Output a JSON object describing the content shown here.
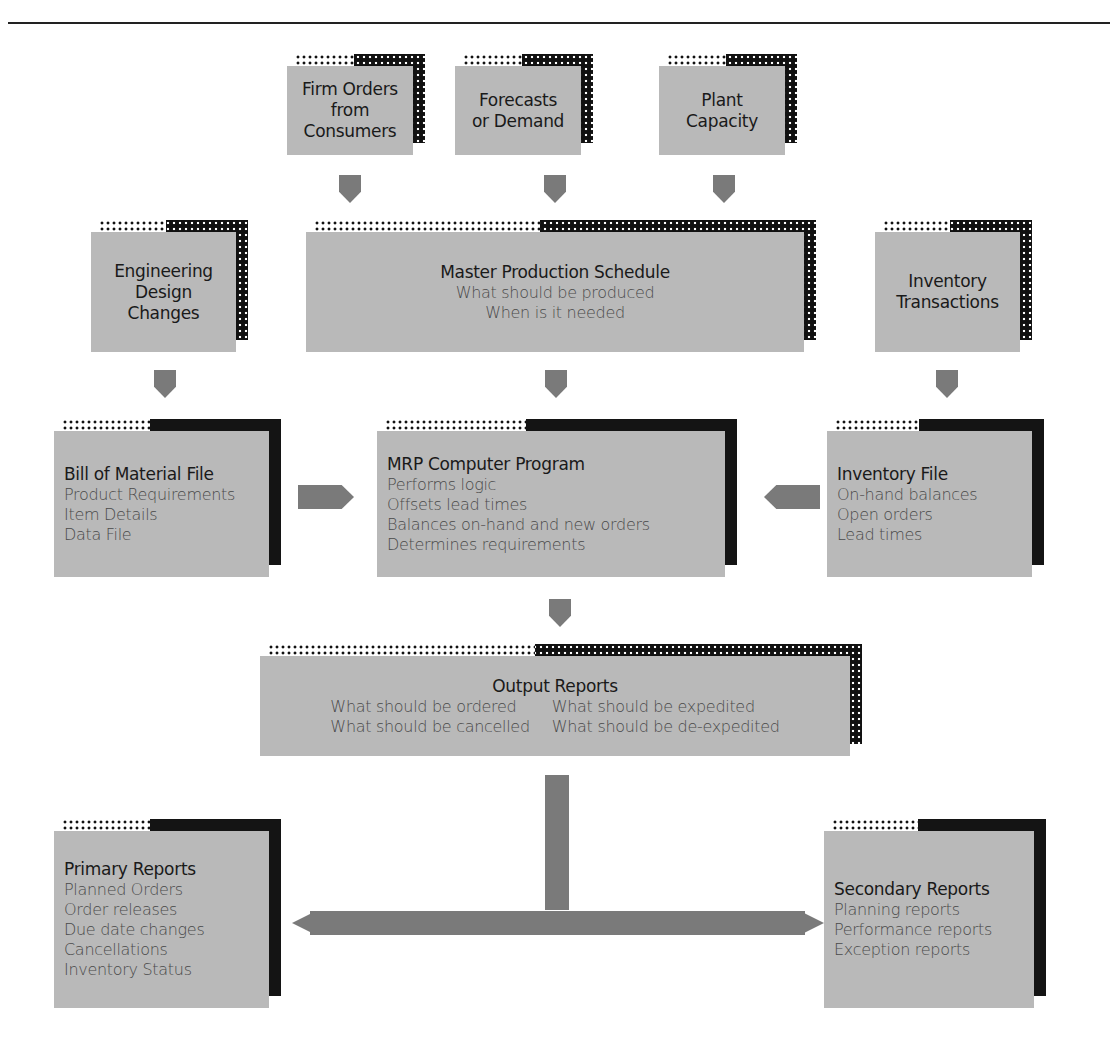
{
  "diagram": {
    "inputs": [
      {
        "id": "firm-orders",
        "lines": [
          "Firm Orders",
          "from",
          "Consumers"
        ]
      },
      {
        "id": "forecasts",
        "lines": [
          "Forecasts",
          "or Demand"
        ]
      },
      {
        "id": "plant-capacity",
        "lines": [
          "Plant",
          "Capacity"
        ]
      }
    ],
    "engineering": {
      "lines": [
        "Engineering",
        "Design",
        "Changes"
      ]
    },
    "mps": {
      "title": "Master Production Schedule",
      "items": [
        "What should be produced",
        "When is it needed"
      ]
    },
    "inventory_transactions": {
      "lines": [
        "Inventory",
        "Transactions"
      ]
    },
    "bom": {
      "title": "Bill of Material File",
      "items": [
        "Product Requirements",
        "Item Details",
        "Data File"
      ]
    },
    "mrp": {
      "title": "MRP Computer Program",
      "items": [
        "Performs logic",
        "Offsets lead times",
        "Balances on-hand and new orders",
        "Determines requirements"
      ]
    },
    "inventory_file": {
      "title": "Inventory File",
      "items": [
        "On-hand balances",
        "Open orders",
        "Lead times"
      ]
    },
    "output": {
      "title": "Output Reports",
      "items": [
        "What should be ordered",
        "What should be expedited",
        "What should be cancelled",
        "What should be de-expedited"
      ]
    },
    "primary": {
      "title": "Primary Reports",
      "items": [
        "Planned Orders",
        "Order releases",
        "Due date changes",
        "Cancellations",
        "Inventory Status"
      ]
    },
    "secondary": {
      "title": "Secondary Reports",
      "items": [
        "Planning reports",
        "Performance reports",
        "Exception reports"
      ]
    },
    "colors": {
      "box_face": "#b9b9b9",
      "shadow": "#111111",
      "arrow": "#7a7a7a",
      "text_title": "#1a1a1a",
      "text_item": "#4a4a4a"
    }
  }
}
